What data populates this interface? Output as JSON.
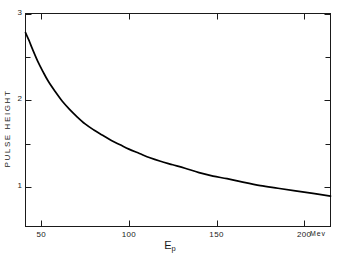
{
  "chart_data": {
    "type": "line",
    "title": "",
    "subtitle": "",
    "xlabel": "E_p",
    "xunit": "Mev",
    "ylabel": "PULSE HEIGHT",
    "xlim": [
      41,
      215
    ],
    "ylim": [
      0.55,
      3.0
    ],
    "grid": false,
    "legend": "none",
    "x_ticks_major": [
      50,
      100,
      150,
      200
    ],
    "x_tick_labels": [
      "50",
      "100",
      "150",
      "200"
    ],
    "y_ticks_major": [
      1,
      2,
      3
    ],
    "y_tick_labels": [
      "1",
      "2",
      "3"
    ],
    "y_ticks_minor": [
      1.5,
      2.5
    ],
    "series": [
      {
        "name": "pulse height vs proton energy",
        "x": [
          41,
          43,
          45,
          48,
          51,
          54,
          58,
          62,
          66,
          70,
          75,
          80,
          85,
          90,
          95,
          100,
          106,
          112,
          118,
          125,
          132,
          140,
          148,
          156,
          165,
          175,
          185,
          195,
          205,
          215
        ],
        "y": [
          2.78,
          2.69,
          2.59,
          2.45,
          2.33,
          2.22,
          2.1,
          1.99,
          1.9,
          1.82,
          1.73,
          1.66,
          1.6,
          1.54,
          1.49,
          1.44,
          1.39,
          1.34,
          1.3,
          1.26,
          1.22,
          1.17,
          1.13,
          1.1,
          1.06,
          1.02,
          0.99,
          0.96,
          0.93,
          0.9
        ]
      }
    ]
  },
  "axes": {
    "y_title": "PULSE  HEIGHT",
    "x_title_main": "E",
    "x_title_sub": "p",
    "x_unit": "Mev"
  },
  "colors": {
    "frame": "#1a1a1a",
    "curve": "#000000",
    "background": "#ffffff",
    "text": "#1a1a1a"
  }
}
